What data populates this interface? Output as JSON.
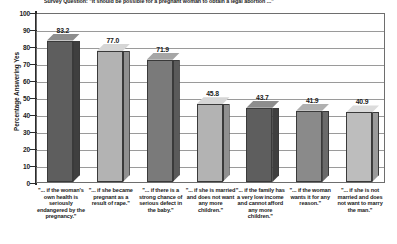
{
  "chart_data": {
    "type": "bar",
    "title": "Survey Question: \"It should be possible for a pregnant woman to obtain a legal abortion ...\"",
    "xlabel": "",
    "ylabel": "Percentage Answering Yes",
    "ylim": [
      0,
      100
    ],
    "ytick_labels": [
      "100",
      "90",
      "80",
      "70",
      "60",
      "50",
      "40",
      "30",
      "20",
      "10",
      "0"
    ],
    "ytick_values": [
      100,
      90,
      80,
      70,
      60,
      50,
      40,
      30,
      20,
      10,
      0
    ],
    "grid": true,
    "legend": "none",
    "categories": [
      "\"... if the woman's own health is seriously endangered by the pregnancy.\"",
      "\"... if she became pregnant as a result of rape.\"",
      "\"... if there is a strong chance of serious defect in the baby.\"",
      "\"... if she is married and does not want any more children.\"",
      "\"... if the family has a very low income and cannot afford any more children.\"",
      "\"... if the woman wants it for any reason.\"",
      "\"... if she is not married and does not want to marry the man.\""
    ],
    "values": [
      83.2,
      77.0,
      71.9,
      45.8,
      43.7,
      41.9,
      40.9
    ],
    "value_labels": [
      "83.2",
      "77.0",
      "71.9",
      "45.8",
      "43.7",
      "41.9",
      "40.9"
    ],
    "bar_colors": [
      "#5e5e5e",
      "#b3b3b3",
      "#7a7a7a",
      "#b3b3b3",
      "#5e5e5e",
      "#8a8a8a",
      "#bdbdbd"
    ],
    "bar_top_colors": [
      "#8d8d8d",
      "#d6d6d6",
      "#a6a6a6",
      "#d6d6d6",
      "#8d8d8d",
      "#b0b0b0",
      "#dcdcdc"
    ],
    "bar_side_colors": [
      "#3f3f3f",
      "#909090",
      "#5a5a5a",
      "#909090",
      "#3f3f3f",
      "#6a6a6a",
      "#9a9a9a"
    ]
  }
}
